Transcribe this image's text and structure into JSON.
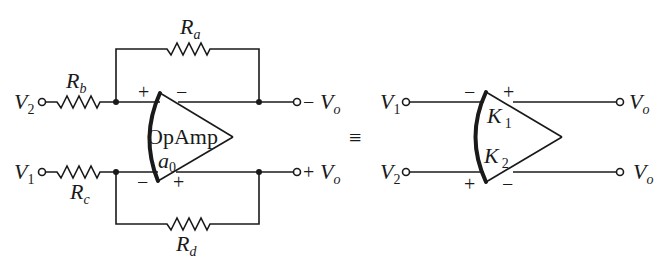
{
  "figure": {
    "left_circuit": {
      "title": "OpAmp differential amplifier with resistor network",
      "inputs": [
        {
          "label": "V",
          "sub": "2",
          "resistor": {
            "label": "R",
            "sub": "b"
          }
        },
        {
          "label": "V",
          "sub": "1",
          "resistor": {
            "label": "R",
            "sub": "c"
          }
        }
      ],
      "feedback": [
        {
          "label": "R",
          "sub": "a"
        },
        {
          "label": "R",
          "sub": "d"
        }
      ],
      "amplifier": {
        "name": "OpAmp",
        "gain_label": "a",
        "gain_sub": "0",
        "input_signs": {
          "top": "+",
          "bottom": "−"
        },
        "output_signs": {
          "top": "−",
          "bottom": "+"
        }
      },
      "outputs": [
        {
          "sign": "−",
          "label": "V",
          "sub": "o"
        },
        {
          "sign": "+",
          "label": "V",
          "sub": "o"
        }
      ]
    },
    "equivalence_symbol": "≡",
    "right_circuit": {
      "title": "Equivalent amplifier",
      "inputs": [
        {
          "label": "V",
          "sub": "1"
        },
        {
          "label": "V",
          "sub": "2"
        }
      ],
      "amplifier": {
        "gains": [
          {
            "label": "K",
            "sub": "1"
          },
          {
            "label": "K",
            "sub": "2"
          }
        ],
        "input_signs": {
          "top": "−",
          "bottom": "+"
        },
        "output_signs": {
          "top": "+",
          "bottom": "−"
        }
      },
      "outputs": [
        {
          "label": "V",
          "sub": "o"
        },
        {
          "label": "V",
          "sub": "o"
        }
      ]
    }
  }
}
